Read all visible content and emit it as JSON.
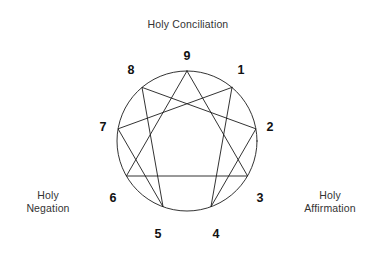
{
  "diagram": {
    "kind": "enneagram",
    "title_labels": {
      "top": "Holy Conciliation",
      "left": "Holy\nNegation",
      "right": "Holy\nAffirmation"
    },
    "colors": {
      "stroke": "#1c1c1c",
      "text": "#333333",
      "number": "#111111",
      "background": "#ffffff"
    },
    "geometry": {
      "center_x": 187,
      "center_y": 141,
      "radius": 70,
      "label_radius": 84
    },
    "points": [
      {
        "number": "9",
        "angle_deg": -90,
        "label_x": 187,
        "label_y": 57
      },
      {
        "number": "1",
        "angle_deg": -50,
        "label_x": 241,
        "label_y": 71
      },
      {
        "number": "2",
        "angle_deg": -10,
        "label_x": 270,
        "label_y": 128
      },
      {
        "number": "3",
        "angle_deg": 30,
        "label_x": 260,
        "label_y": 199
      },
      {
        "number": "4",
        "angle_deg": 70,
        "label_x": 216,
        "label_y": 235
      },
      {
        "number": "5",
        "angle_deg": 110,
        "label_x": 158,
        "label_y": 235
      },
      {
        "number": "6",
        "angle_deg": 150,
        "label_x": 113,
        "label_y": 199
      },
      {
        "number": "7",
        "angle_deg": 190,
        "label_x": 103,
        "label_y": 128
      },
      {
        "number": "8",
        "angle_deg": 230,
        "label_x": 131,
        "label_y": 71
      }
    ],
    "triangle_path": "9-3-6-9",
    "hexad_path": "1-4-2-8-5-7-1"
  },
  "chart_data": {
    "type": "diagram",
    "title": "Holy Conciliation",
    "annotations": [
      "Holy Conciliation",
      "Holy Negation",
      "Holy Affirmation"
    ],
    "categories": [
      "1",
      "2",
      "3",
      "4",
      "5",
      "6",
      "7",
      "8",
      "9"
    ],
    "edges_triangle": [
      [
        "9",
        "3"
      ],
      [
        "3",
        "6"
      ],
      [
        "6",
        "9"
      ]
    ],
    "edges_hexad": [
      [
        "1",
        "4"
      ],
      [
        "4",
        "2"
      ],
      [
        "2",
        "8"
      ],
      [
        "8",
        "5"
      ],
      [
        "5",
        "7"
      ],
      [
        "7",
        "1"
      ]
    ]
  }
}
